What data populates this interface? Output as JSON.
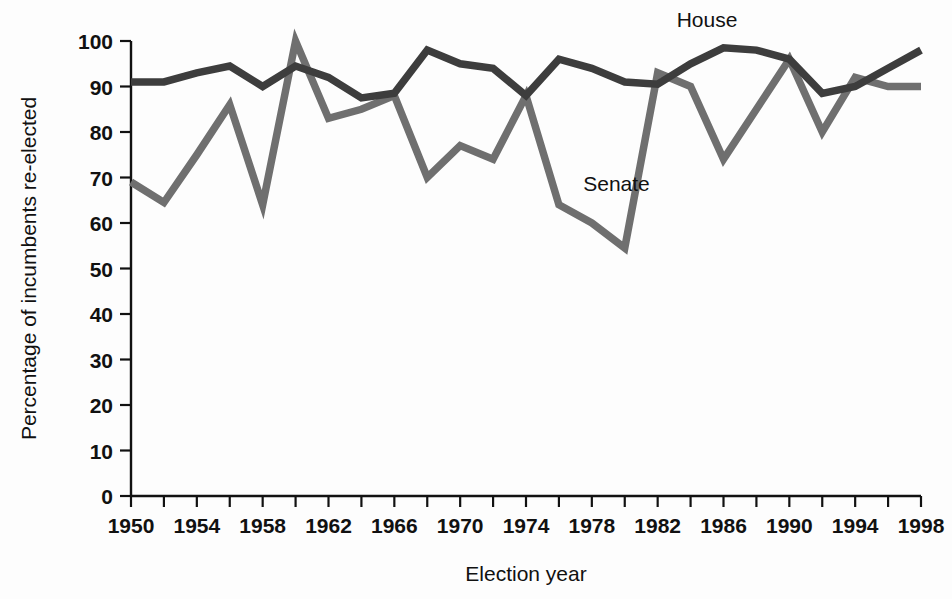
{
  "chart_data": {
    "type": "line",
    "title": "",
    "subtitle": "",
    "xlabel": "Election year",
    "ylabel": "Percentage of incumbents re-elected",
    "xlim": [
      1950,
      1998
    ],
    "ylim": [
      0,
      100
    ],
    "grid": false,
    "legend_position": "inline-annotations",
    "x": [
      1950,
      1952,
      1954,
      1956,
      1958,
      1960,
      1962,
      1964,
      1966,
      1968,
      1970,
      1972,
      1974,
      1976,
      1978,
      1980,
      1982,
      1984,
      1986,
      1988,
      1990,
      1992,
      1994,
      1996,
      1998
    ],
    "x_tick_labels": [
      "1950",
      "1954",
      "1958",
      "1962",
      "1966",
      "1970",
      "1974",
      "1978",
      "1982",
      "1986",
      "1990",
      "1994",
      "1998"
    ],
    "x_tick_values": [
      1950,
      1954,
      1958,
      1962,
      1966,
      1970,
      1974,
      1978,
      1982,
      1986,
      1990,
      1994,
      1998
    ],
    "x_minor_tick_values": [
      1952,
      1956,
      1960,
      1964,
      1968,
      1972,
      1976,
      1980,
      1984,
      1988,
      1992,
      1996
    ],
    "y_tick_labels": [
      "0",
      "10",
      "20",
      "30",
      "40",
      "50",
      "60",
      "70",
      "80",
      "90",
      "100"
    ],
    "y_tick_values": [
      0,
      10,
      20,
      30,
      40,
      50,
      60,
      70,
      80,
      90,
      100
    ],
    "series": [
      {
        "name": "House",
        "color": "#3d3d3d",
        "label_position": {
          "x": 1985,
          "y": 103
        },
        "values": [
          91,
          91,
          93,
          94.5,
          90,
          94.5,
          92,
          87.5,
          88.5,
          98,
          95,
          94,
          88,
          96,
          94,
          91,
          90.5,
          95,
          98.5,
          98,
          96,
          88.5,
          90,
          94,
          98
        ]
      },
      {
        "name": "Senate",
        "color": "#6f6f6f",
        "label_position": {
          "x": 1979.5,
          "y": 67
        },
        "values": [
          69,
          64.5,
          75,
          86,
          64,
          100,
          83,
          85,
          88,
          70,
          77,
          74,
          88,
          64,
          60,
          54.5,
          93,
          90,
          74,
          85,
          96,
          80,
          92,
          90,
          90
        ]
      }
    ]
  },
  "axis_titles": {
    "x": "Election year",
    "y": "Percentage of incumbents re-elected"
  }
}
